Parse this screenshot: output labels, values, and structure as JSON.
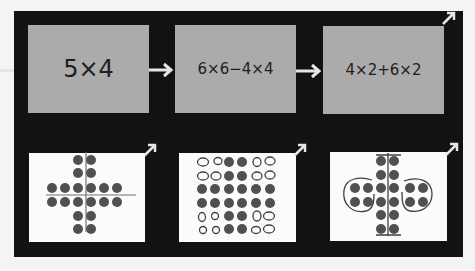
{
  "colors": {
    "background": "#f4f4f4",
    "panel": "#121212",
    "box": "#ababab",
    "text": "#1e1e1e",
    "picture": "#fbfbfb",
    "dot": "#505050",
    "arrow": "#e6e6e6"
  },
  "steps": [
    {
      "expression": "5×4"
    },
    {
      "expression": "6×6−4×4"
    },
    {
      "expression": "4×2+6×2"
    }
  ],
  "pictures": [
    {
      "description": "cross-shaped dot array with horizontal and vertical dividing lines"
    },
    {
      "description": "6×6 dot array with four 2×2 corners shown as hollow (removed) dots"
    },
    {
      "description": "vertical 2×6 column bracketed, with two circled 2×2 groups on either side"
    }
  ]
}
